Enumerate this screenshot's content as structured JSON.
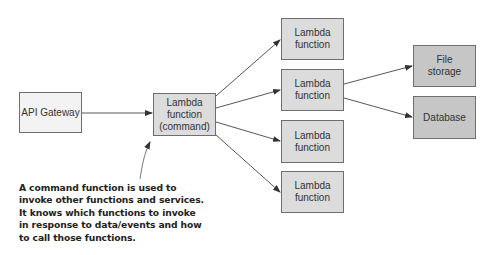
{
  "diagram": {
    "nodes": {
      "api_gateway": {
        "label": "API Gateway"
      },
      "command": {
        "line1": "Lambda",
        "line2": "function",
        "line3": "(command)"
      },
      "lambda1": {
        "line1": "Lambda",
        "line2": "function"
      },
      "lambda2": {
        "line1": "Lambda",
        "line2": "function"
      },
      "lambda3": {
        "line1": "Lambda",
        "line2": "function"
      },
      "lambda4": {
        "line1": "Lambda",
        "line2": "function"
      },
      "file_storage": {
        "line1": "File",
        "line2": "storage"
      },
      "database": {
        "label": "Database"
      }
    },
    "edges": [
      {
        "from": "api_gateway",
        "to": "command"
      },
      {
        "from": "command",
        "to": "lambda1"
      },
      {
        "from": "command",
        "to": "lambda2"
      },
      {
        "from": "command",
        "to": "lambda3"
      },
      {
        "from": "command",
        "to": "lambda4"
      },
      {
        "from": "lambda2",
        "to": "file_storage"
      },
      {
        "from": "lambda2",
        "to": "database"
      }
    ],
    "annotation": {
      "lines": [
        "A command function is used to",
        "invoke other functions and services.",
        "It knows which functions to invoke",
        "in response to data/events and how",
        "to call those functions."
      ],
      "points_to": "command"
    },
    "colors": {
      "light_box": "#f3f3f3",
      "mid_box": "#dcdcdc",
      "dark_box": "#c6c6c6",
      "border": "#6e6e6e",
      "arrow": "#333333"
    }
  }
}
